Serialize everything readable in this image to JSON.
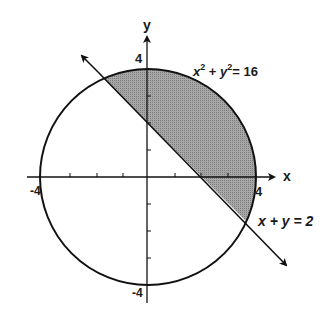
{
  "diagram": {
    "type": "coordinate-plane",
    "axes": {
      "x_label": "x",
      "y_label": "y",
      "tick_labels": {
        "x_pos": "4",
        "x_neg": "-4",
        "y_pos": "4",
        "y_neg": "-4"
      },
      "range": [
        -4,
        4
      ],
      "tick_step": 1
    },
    "curves": {
      "circle": {
        "equation": "x² + y² = 16",
        "label_base_x": "x",
        "label_base_y": "y",
        "exp": "2",
        "rhs": "= 16",
        "radius": 4
      },
      "line": {
        "equation": "x + y = 2",
        "label": "x + y = 2"
      }
    },
    "shaded_region": "inside circle, above line x + y = 2",
    "colors": {
      "stroke": "#111111",
      "shade": "#9a9a9a",
      "background": "#ffffff"
    }
  }
}
